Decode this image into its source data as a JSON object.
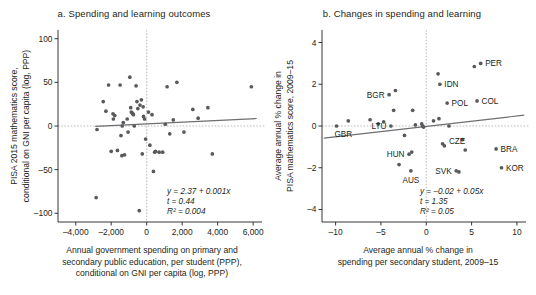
{
  "figure": {
    "panels": [
      {
        "id": "a",
        "title": "a. Spending and learning outcomes",
        "ylabel_line1": "PISA 2015 mathematics score,",
        "ylabel_line2": "conditional on GNI per capita (log, PPP)",
        "xlabel_line1": "Annual government spending on primary and",
        "xlabel_line2": "secondary public education, per student (PPP),",
        "xlabel_line3": "conditional on GNI per capita (log, PPP)",
        "stats": {
          "equation": "y = 2.37 + 0.001x",
          "t": "t = 0.44",
          "r2": "R² = 0.004"
        }
      },
      {
        "id": "b",
        "title": "b. Changes in spending and learning",
        "ylabel_line1": "Average annual % change in",
        "ylabel_line2": "PISA mathematics score, 2009–15",
        "xlabel_line1": "Average annual % change in",
        "xlabel_line2": "spending per secondary student, 2009–15",
        "stats": {
          "equation": "y = –0.02 + 0.05x",
          "t": "t = 1.35",
          "r2": "R² = 0.05"
        }
      }
    ]
  },
  "chart_data": [
    {
      "type": "scatter",
      "panel": "a",
      "title": "a. Spending and learning outcomes",
      "xlabel": "Annual government spending on primary and secondary public education, per student (PPP), conditional on GNI per capita (log, PPP)",
      "ylabel": "PISA 2015 mathematics score, conditional on GNI per capita (log, PPP)",
      "xlim": [
        -5000,
        6500
      ],
      "ylim": [
        -110,
        110
      ],
      "xticks": [
        -4000,
        -2000,
        0,
        2000,
        4000,
        6000
      ],
      "xticklabels": [
        "–4,000",
        "–2,000",
        "0",
        "2,000",
        "4,000",
        "6,000"
      ],
      "yticks": [
        -100,
        -50,
        0,
        50,
        100
      ],
      "yticklabels": [
        "–100",
        "–50",
        "0",
        "50",
        "100"
      ],
      "grid": false,
      "reference_lines": {
        "x": 0,
        "y": 0
      },
      "fit": {
        "slope": 0.001,
        "intercept": 2.37,
        "t": 0.44,
        "r2": 0.004
      },
      "points": [
        [
          -2850,
          -82
        ],
        [
          -2800,
          -4
        ],
        [
          -2450,
          28
        ],
        [
          -2300,
          17
        ],
        [
          -2150,
          47
        ],
        [
          -2000,
          -29
        ],
        [
          -1900,
          14
        ],
        [
          -1880,
          8
        ],
        [
          -1800,
          12
        ],
        [
          -1650,
          -28
        ],
        [
          -1500,
          47
        ],
        [
          -1450,
          -11
        ],
        [
          -1400,
          -34
        ],
        [
          -1380,
          0
        ],
        [
          -1320,
          4
        ],
        [
          -1250,
          -33
        ],
        [
          -1100,
          8
        ],
        [
          -1050,
          -7
        ],
        [
          -950,
          56
        ],
        [
          -900,
          21
        ],
        [
          -870,
          16
        ],
        [
          -820,
          15
        ],
        [
          -780,
          14
        ],
        [
          -750,
          13
        ],
        [
          -700,
          0
        ],
        [
          -600,
          46
        ],
        [
          -550,
          28
        ],
        [
          -500,
          20
        ],
        [
          -420,
          -97
        ],
        [
          -380,
          24
        ],
        [
          -300,
          30
        ],
        [
          -250,
          -32
        ],
        [
          -200,
          22
        ],
        [
          -180,
          11
        ],
        [
          -120,
          8
        ],
        [
          -60,
          -15
        ],
        [
          100,
          16
        ],
        [
          180,
          -22
        ],
        [
          300,
          13
        ],
        [
          380,
          -52
        ],
        [
          450,
          -30
        ],
        [
          500,
          -29
        ],
        [
          700,
          -30
        ],
        [
          900,
          -30
        ],
        [
          1050,
          2
        ],
        [
          1150,
          45
        ],
        [
          1300,
          -9
        ],
        [
          1500,
          7
        ],
        [
          1700,
          50
        ],
        [
          2100,
          -7
        ],
        [
          2600,
          19
        ],
        [
          2900,
          9
        ],
        [
          3450,
          21
        ],
        [
          3700,
          -32
        ],
        [
          5900,
          45
        ]
      ]
    },
    {
      "type": "scatter",
      "panel": "b",
      "title": "b. Changes in spending and learning",
      "xlabel": "Average annual % change in spending per secondary student, 2009–15",
      "ylabel": "Average annual % change in PISA mathematics score, 2009–15",
      "xlim": [
        -11.5,
        11
      ],
      "ylim": [
        -4.6,
        4.6
      ],
      "xticks": [
        -10,
        -5,
        0,
        5,
        10
      ],
      "xticklabels": [
        "–10",
        "–5",
        "0",
        "5",
        "10"
      ],
      "yticks": [
        -4,
        -2,
        0,
        2,
        4
      ],
      "yticklabels": [
        "–4",
        "–2",
        "0",
        "2",
        "4"
      ],
      "grid": false,
      "reference_lines": {
        "x": 0,
        "y": 0
      },
      "fit": {
        "slope": 0.05,
        "intercept": -0.02,
        "t": 1.35,
        "r2": 0.05
      },
      "points": [
        [
          -9.9,
          0.0
        ],
        [
          -8.6,
          0.25
        ],
        [
          -6.2,
          0.3
        ],
        [
          -5.3,
          0.1
        ],
        [
          -4.7,
          0.2
        ],
        [
          -4.1,
          1.5
        ],
        [
          -3.9,
          0.0
        ],
        [
          -3.6,
          0.75
        ],
        [
          -3.4,
          1.7
        ],
        [
          -3.0,
          -1.85
        ],
        [
          -2.4,
          -0.45
        ],
        [
          -1.9,
          -1.35
        ],
        [
          -1.7,
          -2.15
        ],
        [
          -1.6,
          -1.25
        ],
        [
          -1.5,
          0.75
        ],
        [
          -1.2,
          0.05
        ],
        [
          -0.5,
          0.1
        ],
        [
          -0.4,
          0.0
        ],
        [
          -0.3,
          -0.05
        ],
        [
          0.8,
          0.25
        ],
        [
          1.3,
          2.5
        ],
        [
          1.4,
          0.35
        ],
        [
          1.5,
          2.0
        ],
        [
          1.8,
          -0.85
        ],
        [
          2.0,
          -0.95
        ],
        [
          2.3,
          1.1
        ],
        [
          2.5,
          0.0
        ],
        [
          3.3,
          -2.15
        ],
        [
          3.6,
          -2.2
        ],
        [
          4.0,
          -0.65
        ],
        [
          4.3,
          -1.15
        ],
        [
          5.3,
          2.85
        ],
        [
          5.6,
          1.2
        ],
        [
          6.0,
          3.0
        ],
        [
          7.7,
          -1.1
        ],
        [
          8.3,
          -2.0
        ]
      ],
      "annotations": [
        {
          "label": "GBR",
          "x": -9.9,
          "y": 0.0,
          "pos": "below-right"
        },
        {
          "label": "LTU",
          "x": -3.9,
          "y": 0.0,
          "pos": "left"
        },
        {
          "label": "BGR",
          "x": -4.1,
          "y": 1.5,
          "pos": "left"
        },
        {
          "label": "HUN",
          "x": -1.9,
          "y": -1.35,
          "pos": "left"
        },
        {
          "label": "AUS",
          "x": -1.7,
          "y": -2.15,
          "pos": "below-left"
        },
        {
          "label": "IDN",
          "x": 1.5,
          "y": 2.0,
          "pos": "right"
        },
        {
          "label": "POL",
          "x": 2.3,
          "y": 1.1,
          "pos": "right"
        },
        {
          "label": "CZE",
          "x": 2.0,
          "y": -0.7,
          "pos": "right"
        },
        {
          "label": "SVK",
          "x": 3.3,
          "y": -2.15,
          "pos": "left"
        },
        {
          "label": "PER",
          "x": 6.0,
          "y": 3.0,
          "pos": "right"
        },
        {
          "label": "COL",
          "x": 5.6,
          "y": 1.2,
          "pos": "right"
        },
        {
          "label": "BRA",
          "x": 7.7,
          "y": -1.1,
          "pos": "right"
        },
        {
          "label": "KOR",
          "x": 8.3,
          "y": -2.0,
          "pos": "right"
        }
      ]
    }
  ]
}
